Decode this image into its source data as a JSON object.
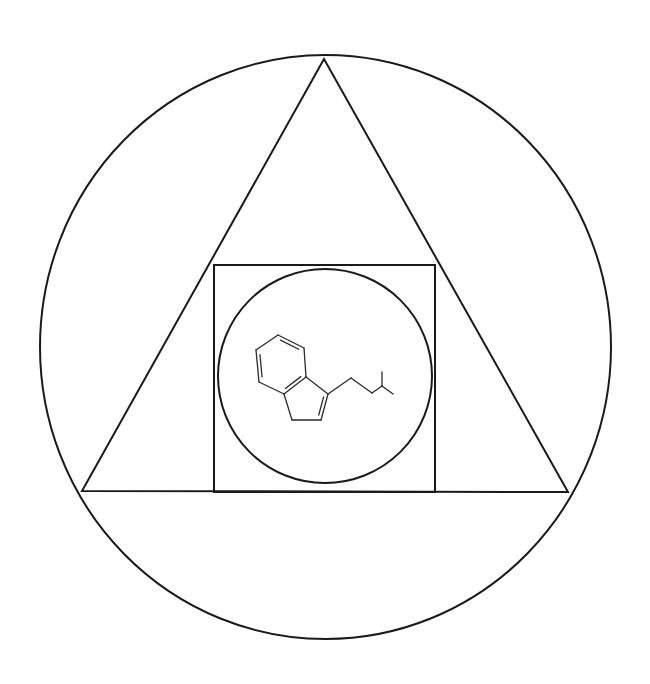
{
  "diagram": {
    "title": "",
    "background": "#ffffff",
    "stroke_color": "#1a1a1a",
    "outer_circle": {
      "cx": 325.5,
      "cy": 347,
      "rx": 285.5,
      "ry": 292
    },
    "triangle": {
      "points": [
        [
          324,
          59
        ],
        [
          82,
          491
        ],
        [
          568,
          492
        ]
      ]
    },
    "square": {
      "x": 214,
      "y": 265,
      "width": 221,
      "height": 227
    },
    "inner_circle": {
      "cx": 325,
      "cy": 376,
      "r": 107
    },
    "molecule": {
      "name": "skeletal-structure",
      "atoms": [
        [
          278,
          335
        ],
        [
          304,
          348
        ],
        [
          306,
          377
        ],
        [
          284,
          394
        ],
        [
          259,
          382
        ],
        [
          256,
          350
        ],
        [
          328,
          394
        ],
        [
          321,
          420
        ],
        [
          292,
          420
        ],
        [
          351,
          378
        ],
        [
          372,
          393
        ],
        [
          382,
          386
        ],
        [
          382,
          372
        ],
        [
          393,
          394
        ]
      ],
      "bonds": [
        [
          0,
          1,
          2
        ],
        [
          1,
          2,
          1
        ],
        [
          2,
          3,
          2
        ],
        [
          3,
          4,
          1
        ],
        [
          4,
          5,
          2
        ],
        [
          5,
          0,
          1
        ],
        [
          2,
          6,
          1
        ],
        [
          6,
          7,
          2
        ],
        [
          7,
          8,
          1
        ],
        [
          8,
          3,
          1
        ],
        [
          6,
          9,
          1
        ],
        [
          9,
          10,
          1
        ],
        [
          10,
          11,
          1
        ],
        [
          11,
          12,
          1
        ],
        [
          11,
          13,
          1
        ]
      ]
    }
  }
}
